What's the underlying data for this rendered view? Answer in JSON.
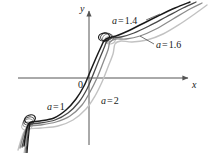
{
  "figure": {
    "background": "#ffffff",
    "width": 208,
    "height": 153
  },
  "axes": {
    "x_label": "x",
    "y_label": "y",
    "origin_label": "0",
    "axis_color": "#555555"
  },
  "annotations": [
    {
      "name": "a-1-4",
      "var": "a",
      "eq": "=",
      "value": "1.4",
      "x": 112,
      "y": 16
    },
    {
      "name": "a-1-6",
      "var": "a",
      "eq": "=",
      "value": "1.6",
      "x": 156,
      "y": 40
    },
    {
      "name": "a-1",
      "var": "a",
      "eq": "=",
      "value": "1",
      "x": 47,
      "y": 102
    },
    {
      "name": "a-2",
      "var": "a",
      "eq": "=",
      "value": "2",
      "x": 101,
      "y": 96
    }
  ],
  "chart_data": {
    "type": "line",
    "title": "",
    "xlabel": "x",
    "ylabel": "y",
    "grid": false,
    "legend": "inline-annotations",
    "origin_label": "0",
    "axis_origin_px": {
      "x": 89,
      "y": 78
    },
    "xlim": [
      -2.6,
      2.6
    ],
    "ylim": [
      -1.8,
      1.9
    ],
    "series": [
      {
        "name": "a = 1",
        "a": 1,
        "color": "#1a1a1a",
        "width": 1.5,
        "cusp_lower_px": [
          30,
          122
        ],
        "cusp_upper_px": [
          104,
          40
        ],
        "points_px": [
          [
            24,
            146
          ],
          [
            26,
            133
          ],
          [
            28,
            125
          ],
          [
            31,
            122
          ],
          [
            40,
            121
          ],
          [
            54,
            118
          ],
          [
            66,
            110
          ],
          [
            76,
            99
          ],
          [
            84,
            86
          ],
          [
            90,
            72
          ],
          [
            96,
            58
          ],
          [
            101,
            47
          ],
          [
            104,
            41
          ],
          [
            108,
            38
          ],
          [
            116,
            36
          ],
          [
            128,
            31
          ],
          [
            142,
            24
          ],
          [
            158,
            16
          ],
          [
            175,
            8
          ],
          [
            190,
            2
          ]
        ]
      },
      {
        "name": "a = 1.4",
        "a": 1.4,
        "color": "#4a4a4a",
        "width": 1.3,
        "cusp_lower_px": [
          29,
          124
        ],
        "cusp_upper_px": [
          106,
          40
        ],
        "points_px": [
          [
            22,
            147
          ],
          [
            25,
            135
          ],
          [
            27,
            127
          ],
          [
            30,
            124
          ],
          [
            40,
            123
          ],
          [
            55,
            120
          ],
          [
            68,
            113
          ],
          [
            79,
            102
          ],
          [
            87,
            89
          ],
          [
            93,
            75
          ],
          [
            99,
            60
          ],
          [
            104,
            48
          ],
          [
            107,
            41
          ],
          [
            112,
            38
          ],
          [
            121,
            37
          ],
          [
            134,
            33
          ],
          [
            149,
            26
          ],
          [
            166,
            17
          ],
          [
            183,
            8
          ],
          [
            196,
            2
          ]
        ]
      },
      {
        "name": "a = 1.6",
        "a": 1.6,
        "color": "#8c8c8c",
        "width": 1.3,
        "cusp_lower_px": [
          28,
          126
        ],
        "cusp_upper_px": [
          108,
          41
        ],
        "points_px": [
          [
            20,
            148
          ],
          [
            23,
            137
          ],
          [
            26,
            129
          ],
          [
            29,
            126
          ],
          [
            40,
            125
          ],
          [
            56,
            122
          ],
          [
            70,
            116
          ],
          [
            82,
            105
          ],
          [
            90,
            92
          ],
          [
            97,
            78
          ],
          [
            103,
            63
          ],
          [
            108,
            50
          ],
          [
            110,
            42
          ],
          [
            116,
            39
          ],
          [
            126,
            39
          ],
          [
            140,
            36
          ],
          [
            156,
            29
          ],
          [
            173,
            19
          ],
          [
            190,
            9
          ],
          [
            202,
            3
          ]
        ]
      },
      {
        "name": "a = 2",
        "a": 2,
        "color": "#c2c2c2",
        "width": 1.4,
        "cusp_lower_px": [
          27,
          129
        ],
        "cusp_upper_px": [
          110,
          43
        ],
        "points_px": [
          [
            18,
            150
          ],
          [
            21,
            140
          ],
          [
            24,
            132
          ],
          [
            28,
            129
          ],
          [
            41,
            128
          ],
          [
            58,
            126
          ],
          [
            73,
            120
          ],
          [
            86,
            109
          ],
          [
            95,
            96
          ],
          [
            102,
            82
          ],
          [
            108,
            67
          ],
          [
            113,
            54
          ],
          [
            115,
            44
          ],
          [
            121,
            41
          ],
          [
            132,
            42
          ],
          [
            147,
            40
          ],
          [
            163,
            34
          ],
          [
            180,
            24
          ],
          [
            196,
            13
          ],
          [
            207,
            5
          ]
        ]
      }
    ]
  }
}
